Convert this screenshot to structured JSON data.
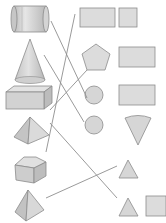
{
  "diagram": {
    "type": "shape-matching-exercise",
    "colors": {
      "fill_light": "#dcdcdc",
      "fill_mid": "#c8c8c8",
      "fill_dark": "#b4b4b4",
      "stroke": "#8c8c8c",
      "line": "#8f8f8f",
      "background": "#ffffff"
    },
    "left_solids": [
      {
        "id": "cylinder",
        "label": "cylinder"
      },
      {
        "id": "cone",
        "label": "cone"
      },
      {
        "id": "cuboid",
        "label": "cuboid"
      },
      {
        "id": "square-pyramid",
        "label": "square pyramid"
      },
      {
        "id": "pentagonal-prism",
        "label": "pentagonal prism"
      },
      {
        "id": "triangular-pyramid",
        "label": "triangular pyramid"
      }
    ],
    "right_shapes": [
      {
        "id": "long-rectangle",
        "label": "rectangle (long)"
      },
      {
        "id": "square-top",
        "label": "square"
      },
      {
        "id": "pentagon",
        "label": "pentagon"
      },
      {
        "id": "rectangle-2",
        "label": "rectangle"
      },
      {
        "id": "circle-1",
        "label": "circle"
      },
      {
        "id": "rectangle-3",
        "label": "rectangle"
      },
      {
        "id": "circle-2",
        "label": "circle"
      },
      {
        "id": "sector",
        "label": "circular sector"
      },
      {
        "id": "triangle-1",
        "label": "triangle"
      },
      {
        "id": "triangle-2",
        "label": "triangle"
      },
      {
        "id": "square-bottom",
        "label": "square"
      }
    ],
    "connections": [
      {
        "from": "cylinder",
        "to": "circle-1"
      },
      {
        "from": "long-rectangle",
        "to": "pentagonal-prism"
      },
      {
        "from": "cone",
        "to": "circle-2"
      },
      {
        "from": "pentagon",
        "to": "cuboid"
      },
      {
        "from": "square-pyramid",
        "to": "triangle-2"
      },
      {
        "from": "triangular-pyramid",
        "to": "triangle-1"
      }
    ]
  }
}
